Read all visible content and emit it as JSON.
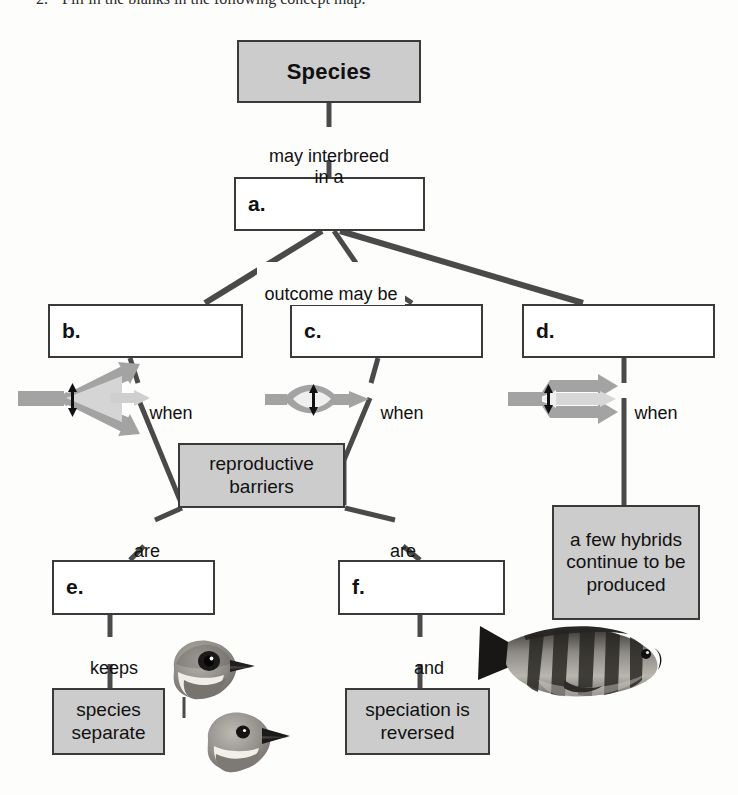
{
  "page": {
    "question_number": "2.",
    "question_text": "Fill in the blanks in the following concept map.",
    "colors": {
      "box_fill_gray": "#cccccc",
      "box_fill_white": "#ffffff",
      "box_border": "#3a3a3a",
      "connector": "#4a4a4a",
      "icon_gray": "#a0a0a0",
      "icon_gray_light": "#c9c9c9",
      "text": "#111111",
      "page_background": "#fdfdfc"
    }
  },
  "concept_map": {
    "type": "concept-map",
    "nodes": [
      {
        "id": "species",
        "label": "Species",
        "style": "filled",
        "blank": false
      },
      {
        "id": "a",
        "label": "a.",
        "style": "white",
        "blank": true
      },
      {
        "id": "b",
        "label": "b.",
        "style": "white",
        "blank": true
      },
      {
        "id": "c",
        "label": "c.",
        "style": "white",
        "blank": true
      },
      {
        "id": "d",
        "label": "d.",
        "style": "white",
        "blank": true
      },
      {
        "id": "barriers",
        "label": "reproductive\nbarriers",
        "style": "filled",
        "blank": false
      },
      {
        "id": "hybrids",
        "label": "a few\nhybrids\ncontinue to\nbe produced",
        "style": "filled",
        "blank": false
      },
      {
        "id": "e",
        "label": "e.",
        "style": "white",
        "blank": true
      },
      {
        "id": "f",
        "label": "f.",
        "style": "white",
        "blank": true
      },
      {
        "id": "separate",
        "label": "species\nseparate",
        "style": "filled",
        "blank": false
      },
      {
        "id": "reversed",
        "label": "speciation is\nreversed",
        "style": "filled",
        "blank": false
      }
    ],
    "edge_labels": [
      {
        "id": "l1",
        "text": "may interbreed\nin a",
        "from": "species",
        "to": "a"
      },
      {
        "id": "l2",
        "text": "outcome may be",
        "from": "a",
        "to": "b, c, d"
      },
      {
        "id": "l3",
        "text": "when",
        "from": "b",
        "to": "barriers"
      },
      {
        "id": "l4",
        "text": "when",
        "from": "c",
        "to": "barriers"
      },
      {
        "id": "l5",
        "text": "when",
        "from": "d",
        "to": "hybrids"
      },
      {
        "id": "l6",
        "text": "are",
        "from": "barriers",
        "to": "e"
      },
      {
        "id": "l7",
        "text": "are",
        "from": "barriers",
        "to": "f"
      },
      {
        "id": "l8",
        "text": "keeps",
        "from": "e",
        "to": "separate"
      },
      {
        "id": "l9",
        "text": "and",
        "from": "f",
        "to": "reversed"
      }
    ],
    "pictograms": [
      {
        "id": "p1",
        "name": "diverging-arrows-icon",
        "description": "two gray arrows diverging from a single stem"
      },
      {
        "id": "p2",
        "name": "lens-loop-arrow-icon",
        "description": "gray arrows splitting then rejoining into one arrow"
      },
      {
        "id": "p3",
        "name": "partial-split-arrows-icon",
        "description": "gray stem splitting into two parallel arrows with a shared middle arrow"
      }
    ],
    "photos": [
      {
        "id": "bird-top",
        "name": "bird-photo-upper",
        "description": "grayscale photo of a small songbird head facing right"
      },
      {
        "id": "bird-bottom",
        "name": "bird-photo-lower",
        "description": "grayscale photo of a second songbird head facing right"
      },
      {
        "id": "fish",
        "name": "cichlid-fish-photo",
        "description": "grayscale photo of a striped cichlid fish facing left"
      }
    ]
  }
}
